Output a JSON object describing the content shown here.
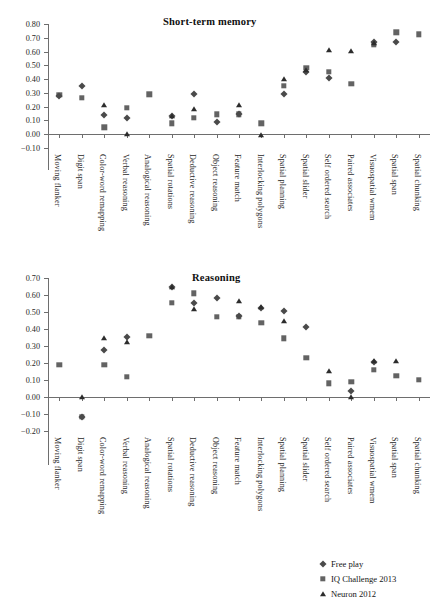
{
  "figure": {
    "width": 435,
    "height": 566,
    "background": "#ffffff"
  },
  "legend": {
    "position": "top-right-of-bottom-panel",
    "entries": [
      {
        "label": "Free play",
        "marker": "diamond",
        "color": "#4a4a4a"
      },
      {
        "label": "IQ Challenge 2013",
        "marker": "square",
        "color": "#636363"
      },
      {
        "label": "Neuron 2012",
        "marker": "triangle",
        "color": "#2c2c2c"
      }
    ]
  },
  "chart_data": [
    {
      "type": "scatter",
      "title": "Short-term memory",
      "xlabel": "",
      "ylabel": "",
      "ylim": [
        -0.1,
        0.8
      ],
      "yticks": [
        "-0.10",
        "0.00",
        "0.10",
        "0.20",
        "0.30",
        "0.40",
        "0.50",
        "0.60",
        "0.70",
        "0.80"
      ],
      "grid": false,
      "legend": "none",
      "categories": [
        "Moving flanker",
        "Digit span",
        "Color-word remapping",
        "Verbal reasoning",
        "Analogical reasoning",
        "Spatial rotations",
        "Deductive reasoning",
        "Object reasoning",
        "Feature match",
        "Interlocking polygons",
        "Spatial planning",
        "Spatial slider",
        "Self ordered search",
        "Paired associates",
        "Visuospatial wmem",
        "Spatial span",
        "Spatial chunking"
      ],
      "series": [
        {
          "name": "Free play",
          "marker": "diamond",
          "values": [
            0.28,
            0.35,
            0.14,
            0.12,
            null,
            0.13,
            0.29,
            0.09,
            0.15,
            null,
            0.29,
            0.45,
            0.41,
            null,
            0.67,
            0.67,
            null
          ]
        },
        {
          "name": "IQ Challenge 2013",
          "marker": "square",
          "values": [
            0.285,
            0.265,
            0.05,
            0.19,
            0.29,
            0.08,
            0.12,
            0.145,
            0.145,
            0.08,
            0.35,
            0.48,
            0.455,
            0.365,
            0.65,
            0.74,
            0.725
          ]
        },
        {
          "name": "Neuron 2012",
          "marker": "triangle",
          "values": [
            null,
            null,
            0.215,
            0.0,
            null,
            0.135,
            0.185,
            null,
            0.21,
            -0.005,
            0.4,
            0.465,
            0.61,
            0.605,
            0.665,
            null,
            null
          ]
        }
      ]
    },
    {
      "type": "scatter",
      "title": "Reasoning",
      "xlabel": "",
      "ylabel": "",
      "ylim": [
        -0.2,
        0.7
      ],
      "yticks": [
        "-0.20",
        "-0.10",
        "0.00",
        "0.10",
        "0.20",
        "0.30",
        "0.40",
        "0.50",
        "0.60",
        "0.70"
      ],
      "grid": false,
      "legend": "upper-right",
      "categories": [
        "Moving flanker",
        "Digit span",
        "Color-word remapping",
        "Verbal reasoning",
        "Analogical reasoning",
        "Spatial rotations",
        "Deductive reasoning",
        "Object reasoning",
        "Feature match",
        "Interlocking polygons",
        "Spatial planning",
        "Spatial slider",
        "Self ordered search",
        "Paired associates",
        "Visuospatial wmem",
        "Spatial span",
        "Spatial chunking"
      ],
      "series": [
        {
          "name": "Free play",
          "marker": "diamond",
          "values": [
            null,
            -0.115,
            0.275,
            0.355,
            null,
            0.645,
            0.555,
            0.585,
            0.475,
            0.525,
            0.505,
            0.41,
            null,
            0.035,
            0.205,
            null,
            null
          ]
        },
        {
          "name": "IQ Challenge 2013",
          "marker": "square",
          "values": [
            0.19,
            -0.115,
            0.19,
            0.12,
            0.36,
            0.555,
            0.61,
            0.47,
            0.47,
            0.435,
            0.345,
            0.23,
            0.08,
            0.09,
            0.16,
            0.125,
            0.1
          ]
        },
        {
          "name": "Neuron 2012",
          "marker": "triangle",
          "values": [
            null,
            0.0,
            0.35,
            0.325,
            null,
            0.65,
            0.515,
            null,
            0.565,
            0.53,
            0.445,
            null,
            0.155,
            0.0,
            0.21,
            0.21,
            null
          ]
        }
      ]
    }
  ]
}
